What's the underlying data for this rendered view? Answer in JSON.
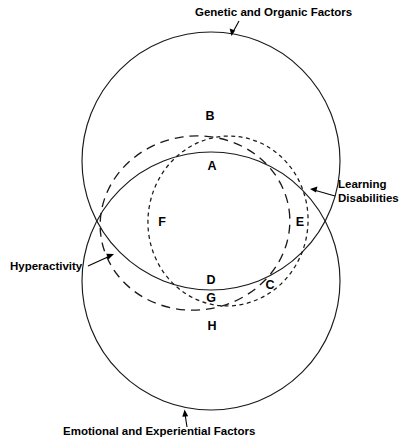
{
  "figure": {
    "title_top": "Genetic and Organic Factors",
    "title_bottom": "Emotional and Experiential Factors",
    "callout_right_line1": "Learning",
    "callout_right_line2": "Disabilities",
    "callout_left": "Hyperactivity",
    "regions": [
      {
        "id": "A",
        "label": "A",
        "x": 212,
        "y": 166
      },
      {
        "id": "B",
        "label": "B",
        "x": 210,
        "y": 117
      },
      {
        "id": "C",
        "label": "C",
        "x": 270,
        "y": 285
      },
      {
        "id": "D",
        "label": "D",
        "x": 211,
        "y": 281
      },
      {
        "id": "E",
        "label": "E",
        "x": 300,
        "y": 223
      },
      {
        "id": "F",
        "label": "F",
        "x": 162,
        "y": 223
      },
      {
        "id": "G",
        "label": "G",
        "x": 211,
        "y": 298
      },
      {
        "id": "H",
        "label": "H",
        "x": 212,
        "y": 327
      }
    ],
    "shapes": {
      "genetic_circle": {
        "cx": 211,
        "cy": 161,
        "r": 129,
        "style": "solid"
      },
      "emotional_circle": {
        "cx": 211,
        "cy": 281,
        "r": 129,
        "style": "solid"
      },
      "hyperactivity_ellipse": {
        "cx": 195,
        "cy": 223,
        "rx": 95,
        "ry": 87,
        "rotate": -8,
        "style": "long-dash"
      },
      "learning_disabilities_ellipse": {
        "cx": 228,
        "cy": 221,
        "rx": 80,
        "ry": 85,
        "rotate": 6,
        "style": "short-dash"
      }
    },
    "colors": {
      "stroke": "#1a1a1a",
      "text": "#000000",
      "background": "#ffffff"
    }
  }
}
